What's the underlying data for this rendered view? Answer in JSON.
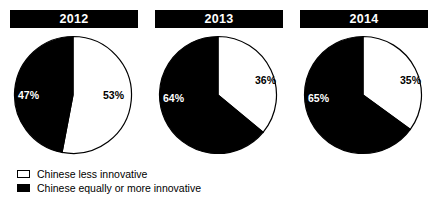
{
  "chart_data": {
    "type": "pie",
    "title": "",
    "subtitle": "",
    "xlabel": "",
    "ylabel": "",
    "grid": false,
    "legend_position": "bottom-left",
    "unit": "%",
    "categories": [
      "Chinese less innovative",
      "Chinese equally or more innovative"
    ],
    "colors": [
      "#ffffff",
      "#000000"
    ],
    "panels": [
      {
        "label": "2012",
        "slices": [
          {
            "name": "Chinese less innovative",
            "value": 53,
            "display": "53%",
            "color": "#ffffff"
          },
          {
            "name": "Chinese equally or more innovative",
            "value": 47,
            "display": "47%",
            "color": "#000000"
          }
        ]
      },
      {
        "label": "2013",
        "slices": [
          {
            "name": "Chinese less innovative",
            "value": 36,
            "display": "36%",
            "color": "#ffffff"
          },
          {
            "name": "Chinese equally or more innovative",
            "value": 64,
            "display": "64%",
            "color": "#000000"
          }
        ]
      },
      {
        "label": "2014",
        "slices": [
          {
            "name": "Chinese less innovative",
            "value": 35,
            "display": "35%",
            "color": "#ffffff"
          },
          {
            "name": "Chinese equally or more innovative",
            "value": 65,
            "display": "65%",
            "color": "#000000"
          }
        ]
      }
    ],
    "legend": [
      {
        "swatch": "white",
        "label": "Chinese less innovative"
      },
      {
        "swatch": "black",
        "label": "Chinese equally or more innovative"
      }
    ]
  }
}
